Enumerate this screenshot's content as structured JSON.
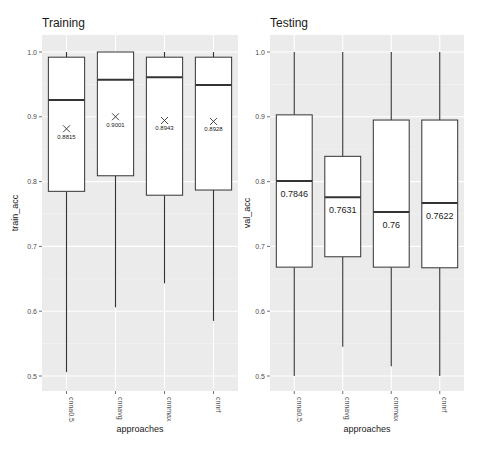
{
  "chart_data": [
    {
      "type": "box",
      "title": "Training",
      "xlabel": "approaches",
      "ylabel": "train_acc",
      "ylim": [
        0.48,
        1.02
      ],
      "yticks": [
        "0.5",
        "0.6",
        "0.7",
        "0.8",
        "0.9",
        "1.0"
      ],
      "categories": [
        "cnna0.5",
        "cnnavg",
        "cnnmax",
        "cnnrf"
      ],
      "boxes": [
        {
          "category": "cnna0.5",
          "whisker_low": 0.506,
          "q1": 0.785,
          "median": 0.926,
          "q3": 0.992,
          "whisker_high": 1.0,
          "mean": 0.8815,
          "label": "0.8815"
        },
        {
          "category": "cnnavg",
          "whisker_low": 0.606,
          "q1": 0.809,
          "median": 0.957,
          "q3": 1.0,
          "whisker_high": 1.0,
          "mean": 0.9001,
          "label": "0.9001"
        },
        {
          "category": "cnnmax",
          "whisker_low": 0.643,
          "q1": 0.779,
          "median": 0.961,
          "q3": 0.992,
          "whisker_high": 1.0,
          "mean": 0.8943,
          "label": "0.8943"
        },
        {
          "category": "cnnrf",
          "whisker_low": 0.585,
          "q1": 0.787,
          "median": 0.949,
          "q3": 0.992,
          "whisker_high": 1.0,
          "mean": 0.8928,
          "label": "0.8928"
        }
      ],
      "annotation_style": "mean marker X with label",
      "grid": true,
      "background": "#ebebeb"
    },
    {
      "type": "box",
      "title": "Testing",
      "xlabel": "approaches",
      "ylabel": "val_acc",
      "ylim": [
        0.48,
        1.02
      ],
      "yticks": [
        "0.5",
        "0.6",
        "0.7",
        "0.8",
        "0.9",
        "1.0"
      ],
      "categories": [
        "cnna0.5",
        "cnnavg",
        "cnnmax",
        "cnnrf"
      ],
      "boxes": [
        {
          "category": "cnna0.5",
          "whisker_low": 0.5,
          "q1": 0.668,
          "median": 0.801,
          "q3": 0.903,
          "whisker_high": 1.0,
          "label": "0.7846"
        },
        {
          "category": "cnnavg",
          "whisker_low": 0.545,
          "q1": 0.684,
          "median": 0.776,
          "q3": 0.839,
          "whisker_high": 1.0,
          "label": "0.7631"
        },
        {
          "category": "cnnmax",
          "whisker_low": 0.515,
          "q1": 0.668,
          "median": 0.753,
          "q3": 0.895,
          "whisker_high": 1.0,
          "label": "0.76"
        },
        {
          "category": "cnnrf",
          "whisker_low": 0.5,
          "q1": 0.667,
          "median": 0.767,
          "q3": 0.895,
          "whisker_high": 1.0,
          "label": "0.7622"
        }
      ],
      "annotation_style": "value label below median",
      "grid": true,
      "background": "#ebebeb"
    }
  ]
}
